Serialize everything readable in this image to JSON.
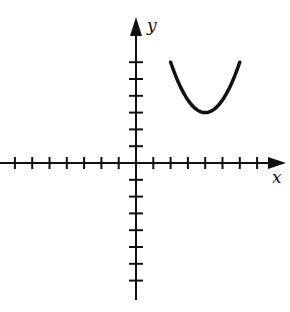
{
  "figure": {
    "x_axis_label": "x",
    "y_axis_label": "y",
    "x_ticks_left": 7,
    "x_ticks_right": 7,
    "y_ticks_up": 6,
    "y_ticks_down": 7,
    "curve": {
      "shape": "parabola opening upward",
      "left_end": [
        2,
        6
      ],
      "vertex": [
        4,
        3
      ],
      "right_end": [
        6,
        6
      ]
    },
    "colors": {
      "stroke": "#111111",
      "background": "#ffffff"
    }
  }
}
